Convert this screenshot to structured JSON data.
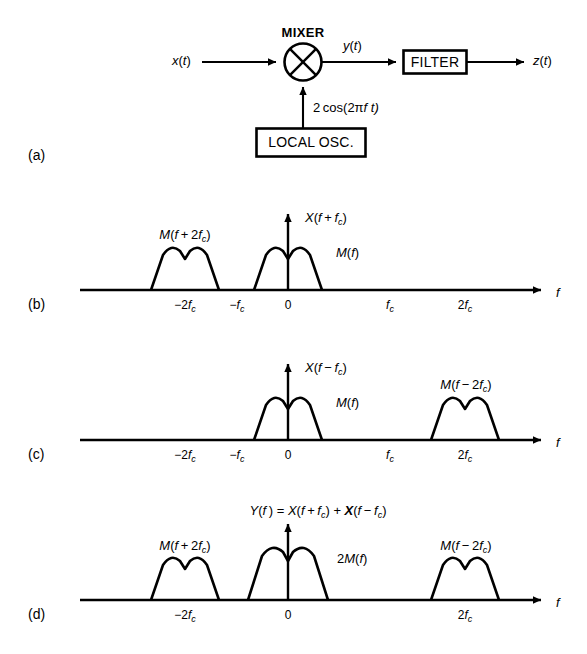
{
  "figure": {
    "background": "#ffffff",
    "stroke": "#000000",
    "width": 587,
    "height": 654
  },
  "panel_a": {
    "tag": "(a)",
    "mixer_caption": "MIXER",
    "input_label": "x(t)",
    "mid_label": "y(t)",
    "output_label": "z(t)",
    "filter_label": "FILTER",
    "oscillator_label": "LOCAL OSC.",
    "lo_signal_label": "2 cos(2πf t)",
    "lo_signal_parts": {
      "coef": "2 cos(2π",
      "var": "f",
      "tail": " t)"
    },
    "icons": {
      "mixer": "multiplier-circle-icon",
      "arrow": "arrow-right-icon"
    }
  },
  "panel_b": {
    "tag": "(b)",
    "y_axis_label": "X(f + f_c)",
    "axis_x_label": "f",
    "ticks": [
      "−2f_c",
      "−f_c",
      "0",
      "f_c",
      "2f_c"
    ],
    "tick_text": {
      "neg2fc": "−2f",
      "negfc": "−f",
      "zero": "0",
      "fc": "f",
      "pos2fc": "2f",
      "sub": "c"
    },
    "spectra": [
      {
        "name": "M(f + 2f_c)",
        "center_tick": "−2f_c",
        "label_base": "M(f + 2f",
        "label_sub": "c",
        "label_close": ")"
      },
      {
        "name": "M(f)",
        "center_tick": "0",
        "label_base": "M(f",
        "label_sub": "",
        "label_close": ")"
      }
    ]
  },
  "panel_c": {
    "tag": "(c)",
    "y_axis_label": "X(f − f_c)",
    "axis_x_label": "f",
    "ticks": [
      "−2f_c",
      "−f_c",
      "0",
      "f_c",
      "2f_c"
    ],
    "spectra": [
      {
        "name": "M(f)",
        "center_tick": "0"
      },
      {
        "name": "M(f − 2f_c)",
        "center_tick": "2f_c"
      }
    ]
  },
  "panel_d": {
    "tag": "(d)",
    "equation": "Y(f ) = X(f + f_c) + X(f − f_c)",
    "equation_parts": {
      "p1": "Y(f ) = X(f + f",
      "s1": "c",
      "p2": ") + ",
      "bold_x": "X",
      "p3": "(f − f",
      "s2": "c",
      "p4": ")"
    },
    "axis_x_label": "f",
    "ticks": [
      "−2f_c",
      "0",
      "2f_c"
    ],
    "center_label": "2M(f)",
    "spectra": [
      {
        "name": "M(f + 2f_c)",
        "center_tick": "−2f_c"
      },
      {
        "name": "2M(f)",
        "center_tick": "0"
      },
      {
        "name": "M(f − 2f_c)",
        "center_tick": "2f_c"
      }
    ]
  }
}
